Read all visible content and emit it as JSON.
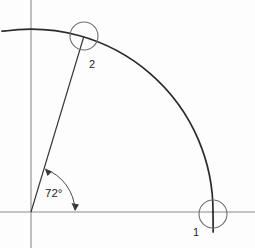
{
  "figure": {
    "background_color": "#fdfdfd",
    "axes": {
      "horizontal": {
        "name": "x-axis",
        "color": "#8c8c8c",
        "y": 212
      },
      "vertical": {
        "name": "y-axis",
        "color": "#8c8c8c",
        "x": 31
      },
      "origin": {
        "x": 31,
        "y": 212
      }
    },
    "arc": {
      "color": "#2b2b2b",
      "radius": 182,
      "start_angle_deg": 0,
      "end_angle_deg": 95
    },
    "angle": {
      "value_deg": 72,
      "label": "72°",
      "marker_radius": 45,
      "arrowheads": "double"
    },
    "points": [
      {
        "id": "point-1",
        "label": "1",
        "x": 213,
        "y": 214,
        "marker_radius": 14,
        "marker_color": "#6e6e6e",
        "label_x": 193,
        "label_y": 235
      },
      {
        "id": "point-2",
        "label": "2",
        "x": 84,
        "y": 36,
        "marker_radius": 14,
        "marker_color": "#6e6e6e",
        "label_x": 89,
        "label_y": 67
      }
    ],
    "radial_line": {
      "from_x": 31,
      "from_y": 212,
      "to_x": 84,
      "to_y": 36,
      "color": "#3a3a3a"
    }
  }
}
